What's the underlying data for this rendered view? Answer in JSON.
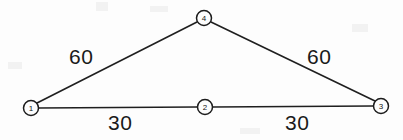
{
  "diagram": {
    "background_color": "#fdfdfd",
    "line_color": "#1f1f1f",
    "label_color": "#1a1a1a",
    "nodes": [
      {
        "id": "1",
        "label": "1",
        "cx": 31,
        "cy": 108,
        "r": 7.5
      },
      {
        "id": "2",
        "label": "2",
        "cx": 205,
        "cy": 107,
        "r": 7.5
      },
      {
        "id": "3",
        "label": "3",
        "cx": 381,
        "cy": 106,
        "r": 7.5
      },
      {
        "id": "4",
        "label": "4",
        "cx": 204,
        "cy": 18,
        "r": 7.5
      }
    ],
    "edges": [
      {
        "id": "e-1-4",
        "from": "1",
        "to": "4",
        "weight": "60",
        "label_x": 69,
        "label_y": 46
      },
      {
        "id": "e-4-3",
        "from": "4",
        "to": "3",
        "weight": "60",
        "label_x": 307,
        "label_y": 46
      },
      {
        "id": "e-1-2",
        "from": "1",
        "to": "2",
        "weight": "30",
        "label_x": 108,
        "label_y": 112
      },
      {
        "id": "e-2-3",
        "from": "2",
        "to": "3",
        "weight": "30",
        "label_x": 285,
        "label_y": 112
      }
    ]
  }
}
